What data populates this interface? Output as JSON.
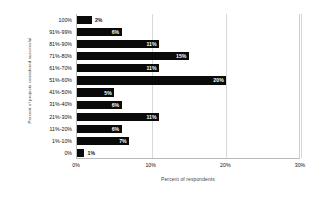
{
  "chart_data": {
    "type": "bar",
    "orientation": "horizontal",
    "title": "",
    "xlabel": "Percent of respondents",
    "ylabel": "Percent of projects considered successful",
    "categories": [
      "100%",
      "91%-99%",
      "81%-90%",
      "71%-80%",
      "61%-70%",
      "51%-60%",
      "41%-50%",
      "31%-40%",
      "21%-30%",
      "11%-20%",
      "1%-10%",
      "0%"
    ],
    "values": [
      2,
      6,
      11,
      15,
      11,
      20,
      5,
      6,
      11,
      6,
      7,
      1
    ],
    "value_labels": [
      "2%",
      "6%",
      "11%",
      "15%",
      "11%",
      "20%",
      "5%",
      "6%",
      "11%",
      "6%",
      "7%",
      "1%"
    ],
    "xlim": [
      0,
      30
    ],
    "xticks": [
      0,
      10,
      20,
      30
    ],
    "xtick_labels": [
      "0%",
      "10%",
      "20%",
      "30%"
    ],
    "grid": "vertical",
    "legend": "none",
    "bar_color": "#0a0a0a",
    "label_color_inside": "#ffffff",
    "label_color_outside": "#111111",
    "grid_color": "#d8d8d8",
    "axis_color": "#b9b9b9",
    "background": "#ffffff"
  }
}
